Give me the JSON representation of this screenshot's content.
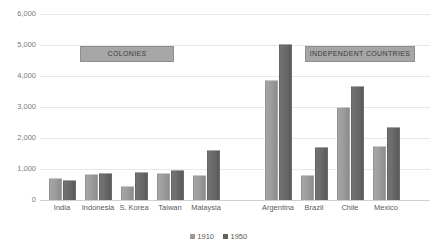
{
  "chart_data": {
    "type": "bar",
    "title": "",
    "subtitle": "",
    "xlabel": "",
    "ylabel": "",
    "ylim": [
      0,
      6000
    ],
    "ytick_labels": [
      "6,000",
      "5,000",
      "4,000",
      "3,000",
      "2,000",
      "1,000",
      "0"
    ],
    "ytick_values": [
      6000,
      5000,
      4000,
      3000,
      2000,
      1000,
      0
    ],
    "grid": true,
    "legend_position": "bottom-center",
    "categories": [
      "India",
      "Indonesia",
      "S. Korea",
      "Taiwan",
      "Malaysia",
      "Argentina",
      "Brazil",
      "Chile",
      "Mexico"
    ],
    "series": [
      {
        "name": "1910",
        "color": "#9a9a9a",
        "values": [
          670,
          820,
          430,
          830,
          790,
          3850,
          780,
          2980,
          1700
        ]
      },
      {
        "name": "1950",
        "color": "#5f5f5f",
        "values": [
          620,
          850,
          880,
          930,
          1570,
          5000,
          1670,
          3650,
          2330
        ]
      }
    ],
    "annotations": [
      {
        "name": "colonies",
        "text": "COLONIES",
        "covers": [
          "India",
          "Indonesia",
          "S. Korea",
          "Taiwan",
          "Malaysia"
        ]
      },
      {
        "name": "independent-countries",
        "text": "INDEPENDENT COUNTRIES",
        "covers": [
          "Argentina",
          "Brazil",
          "Chile",
          "Mexico"
        ]
      }
    ]
  },
  "legend": {
    "items": [
      {
        "label": "1910"
      },
      {
        "label": "1950"
      }
    ]
  },
  "axis": {
    "y": {
      "ticks": [
        {
          "label": "6,000"
        },
        {
          "label": "5,000"
        },
        {
          "label": "4,000"
        },
        {
          "label": "3,000"
        },
        {
          "label": "2,000"
        },
        {
          "label": "1,000"
        },
        {
          "label": "0"
        }
      ]
    },
    "x": {
      "ticks": [
        {
          "label": "India"
        },
        {
          "label": "Indonesia"
        },
        {
          "label": "S. Korea"
        },
        {
          "label": "Taiwan"
        },
        {
          "label": "Malaysia"
        },
        {
          "label": "Argentina"
        },
        {
          "label": "Brazil"
        },
        {
          "label": "Chile"
        },
        {
          "label": "Mexico"
        }
      ]
    }
  },
  "banners": {
    "colonies": "COLONIES",
    "independent": "INDEPENDENT COUNTRIES"
  }
}
